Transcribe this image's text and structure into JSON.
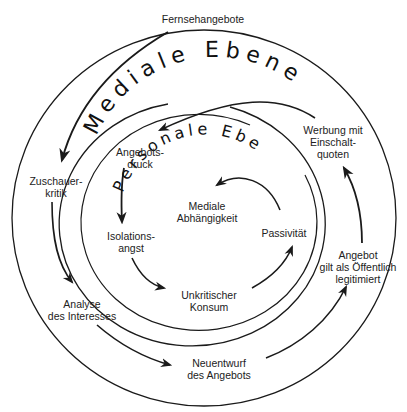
{
  "title_top": "Fernsehangebote",
  "levels": {
    "outer": "Mediale Ebene",
    "inner": "Personale Ebene"
  },
  "outer_cycle": [
    {
      "id": "zuschauerkritik",
      "line1": "Zuschauer-",
      "line2": "kritik"
    },
    {
      "id": "analyse",
      "line1": "Analyse",
      "line2": "des Interesses"
    },
    {
      "id": "neuentwurf",
      "line1": "Neuentwurf",
      "line2": "des Angebots"
    },
    {
      "id": "legitimiert",
      "line1": "Angebot",
      "line2": "gilt als Öffentlich",
      "line3": "legitimiert"
    },
    {
      "id": "werbung",
      "line1": "Werbung mit",
      "line2": "Einschalt-",
      "line3": "quoten"
    }
  ],
  "inner_cycle": [
    {
      "id": "angebotsdruck",
      "line1": "Angebots-",
      "line2": "druck"
    },
    {
      "id": "isolationsangst",
      "line1": "Isolations-",
      "line2": "angst"
    },
    {
      "id": "konsum",
      "line1": "Unkritischer",
      "line2": "Konsum"
    },
    {
      "id": "passivitaet",
      "line1": "Passivität"
    },
    {
      "id": "abhaengigkeit",
      "line1": "Mediale",
      "line2": "Abhängigkeit"
    }
  ],
  "colors": {
    "stroke": "#1a1a1a",
    "background": "#ffffff"
  }
}
